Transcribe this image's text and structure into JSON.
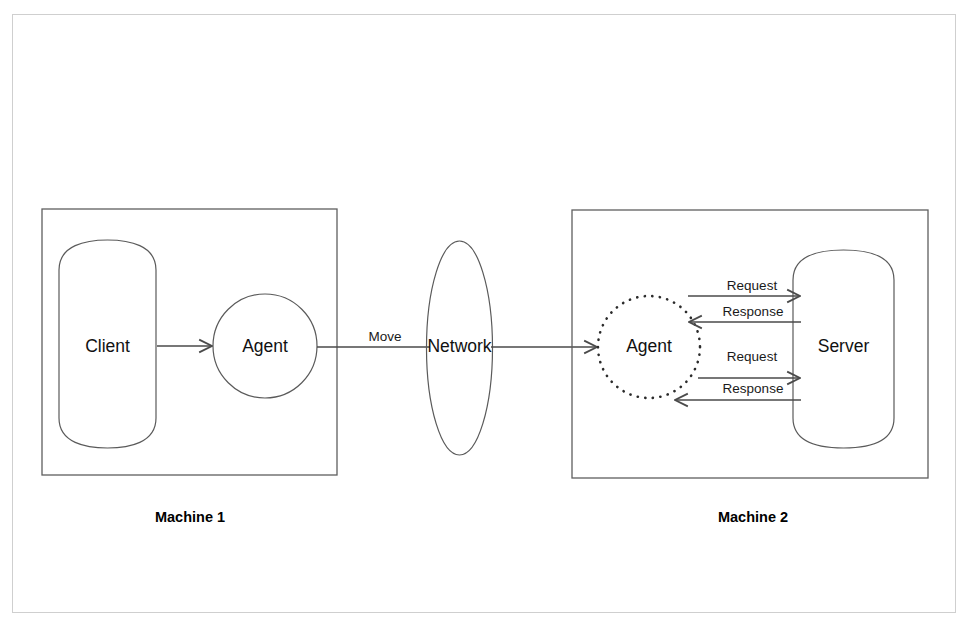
{
  "figure": {
    "type": "diagram",
    "subtype": "mobile-agent-architecture",
    "background_color": "#ffffff",
    "frame_color": "#cfcfcf",
    "stroke_color": "#5a5a5a"
  },
  "machine1": {
    "label": "Machine 1",
    "nodes": {
      "client": {
        "label": "Client",
        "shape": "cylinder"
      },
      "agent": {
        "label": "Agent",
        "shape": "circle-solid"
      }
    },
    "edges": [
      {
        "label": "",
        "from": "Client",
        "to": "Agent",
        "direction": "right"
      }
    ]
  },
  "network": {
    "label": "Network",
    "shape": "ellipse"
  },
  "transit": {
    "move_label": "Move",
    "edges": [
      {
        "label": "Move",
        "from": "Agent",
        "to": "Network",
        "direction": "right"
      },
      {
        "label": "",
        "from": "Network",
        "to": "Agent",
        "direction": "right"
      }
    ]
  },
  "machine2": {
    "label": "Machine 2",
    "nodes": {
      "agent": {
        "label": "Agent",
        "shape": "circle-dotted"
      },
      "server": {
        "label": "Server",
        "shape": "cylinder"
      }
    },
    "edges": [
      {
        "label": "Request",
        "from": "Agent",
        "to": "Server",
        "direction": "right"
      },
      {
        "label": "Response",
        "from": "Server",
        "to": "Agent",
        "direction": "left"
      },
      {
        "label": "Request",
        "from": "Agent",
        "to": "Server",
        "direction": "right"
      },
      {
        "label": "Response",
        "from": "Server",
        "to": "Agent",
        "direction": "left"
      }
    ]
  }
}
